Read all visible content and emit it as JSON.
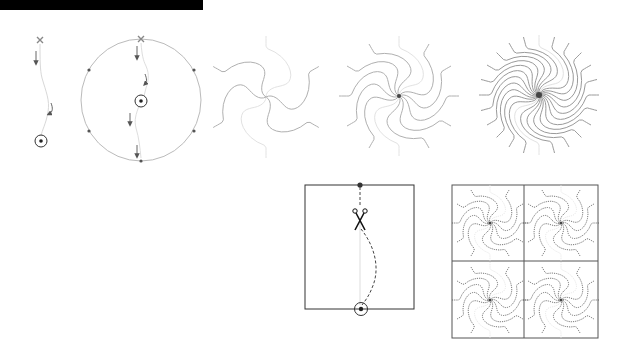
{
  "diagram": {
    "colors": {
      "background": "#ffffff",
      "topbar": "#000000",
      "curve": "#b0b0b0",
      "faint_curve": "#dedede",
      "stroke": "#555555",
      "dark": "#222222",
      "dot": "#555555"
    },
    "panels": [
      {
        "id": "single-path",
        "start_marker": "x-mark-icon",
        "end_marker": "target-icon",
        "arrows": 2
      },
      {
        "id": "circle-path",
        "start_marker": "x-mark-icon",
        "center_marker": "target-icon",
        "arrows": 4,
        "perimeter_dots": 6
      },
      {
        "id": "spiral-6",
        "arms": 6
      },
      {
        "id": "spiral-12",
        "arms": 12
      },
      {
        "id": "spiral-24",
        "arms": 24
      },
      {
        "id": "cut-square",
        "markers": [
          "dot-icon",
          "scissors-icon",
          "target-icon"
        ]
      },
      {
        "id": "tiled-square",
        "tiles": 4,
        "arms_per_tile": 12
      }
    ],
    "scissors_glyph": "✂"
  }
}
